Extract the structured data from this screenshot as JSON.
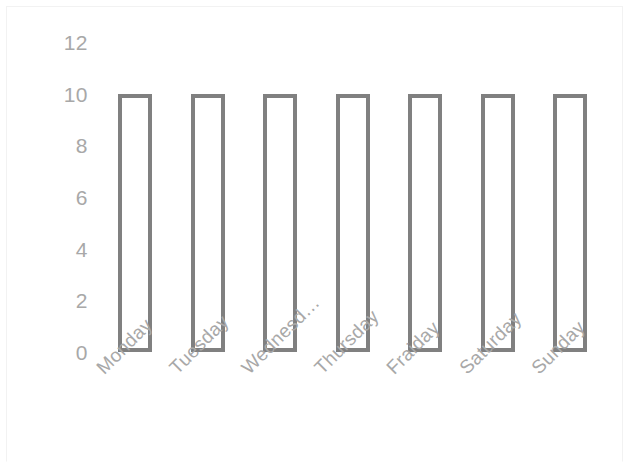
{
  "chart_data": {
    "type": "bar",
    "title": "",
    "subtitle": "",
    "xlabel": "",
    "ylabel": "",
    "categories": [
      "Monday",
      "Tuesday",
      "Wednesd…",
      "Thursday",
      "Fraiday",
      "Saturday",
      "Sunday"
    ],
    "values": [
      10,
      10,
      10,
      10,
      10,
      10,
      10
    ],
    "series": [
      {
        "name": "",
        "values": [
          10,
          10,
          10,
          10,
          10,
          10,
          10
        ]
      }
    ],
    "ylim": [
      0,
      12
    ],
    "y_ticks": [
      12,
      10,
      8,
      6,
      4,
      2,
      0
    ],
    "y_tick_labels": [
      "12",
      "10",
      "8",
      "6",
      "4",
      "2",
      "0"
    ],
    "x_tick_labels": [
      "Monday",
      "Tuesday",
      "Wednesd…",
      "Thursday",
      "Fraiday",
      "Saturday",
      "Sunday"
    ],
    "grid": false,
    "legend": false,
    "legend_position": "none",
    "annotations": [],
    "bar_style": "outlined",
    "bar_fill_color": "#ffffff",
    "bar_border_color": "#808080",
    "tick_label_color": "#a8a8a8",
    "x_label_rotation_deg": -45,
    "frame_color": "#f2f2f2",
    "background_color": "#ffffff"
  },
  "axis": {
    "y_ticks": [
      {
        "label": "12",
        "value": 12
      },
      {
        "label": "10",
        "value": 10
      },
      {
        "label": "8",
        "value": 8
      },
      {
        "label": "6",
        "value": 6
      },
      {
        "label": "4",
        "value": 4
      },
      {
        "label": "2",
        "value": 2
      },
      {
        "label": "0",
        "value": 0
      }
    ],
    "x_ticks": [
      {
        "label": "Monday"
      },
      {
        "label": "Tuesday"
      },
      {
        "label": "Wednesd…"
      },
      {
        "label": "Thursday"
      },
      {
        "label": "Fraiday"
      },
      {
        "label": "Saturday"
      },
      {
        "label": "Sunday"
      }
    ]
  },
  "layout": {
    "plot_left": 118,
    "plot_bottom_y": 352,
    "plot_top_y": 42,
    "bar_width": 34,
    "bar_pitch": 72.5,
    "value_top_y": 94,
    "x_label_baseline_y": 364
  }
}
